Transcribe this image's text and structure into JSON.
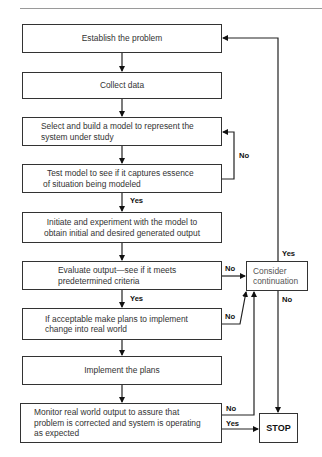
{
  "flowchart": {
    "boxes": {
      "establish": "Establish the problem",
      "collect": "Collect data",
      "select_line1": "Select and build a model to represent the",
      "select_line2": "system under study",
      "test_line1": "Test model to see if it captures essence",
      "test_line2": "of situation being modeled",
      "initiate_line1": "Initiate and experiment with the model to",
      "initiate_line2": "obtain initial and desired generated output",
      "evaluate_line1": "Evaluate output—see if it meets",
      "evaluate_line2": "predetermined criteria",
      "acceptable_line1": "If acceptable make plans to implement",
      "acceptable_line2": "change into real world",
      "implement": "Implement the plans",
      "monitor_line1": "Monitor real world output to assure that",
      "monitor_line2": "problem is corrected and system is operating",
      "monitor_line3": "as expected",
      "consider_line1": "Consider",
      "consider_line2": "continuation",
      "stop": "STOP"
    },
    "labels": {
      "test_no": "No",
      "test_yes": "Yes",
      "evaluate_no": "No",
      "evaluate_yes": "Yes",
      "acceptable_no": "No",
      "consider_yes": "Yes",
      "consider_no": "No",
      "monitor_no": "No",
      "monitor_yes": "Yes"
    }
  }
}
